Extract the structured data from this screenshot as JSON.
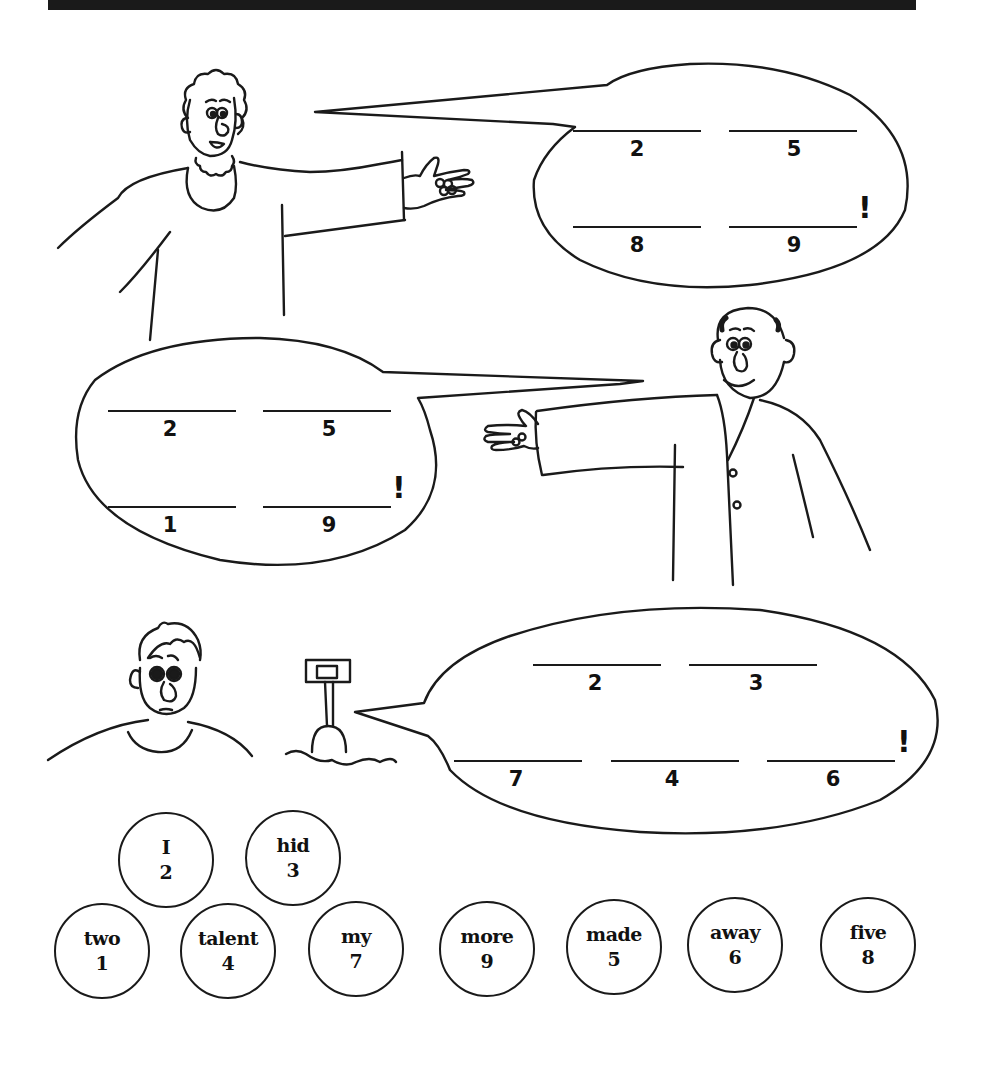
{
  "page": {
    "header_bar_color": "#1a1a1a",
    "line_color": "#1a1a1a"
  },
  "panels": [
    {
      "id": "panel-1",
      "character": "curly-haired woman holding coins",
      "speech_bubble": {
        "rows": [
          [
            {
              "number": "2"
            },
            {
              "number": "5"
            }
          ],
          [
            {
              "number": "8"
            },
            {
              "number": "9"
            }
          ]
        ],
        "ending": "!"
      }
    },
    {
      "id": "panel-2",
      "character": "balding man holding coins",
      "speech_bubble": {
        "rows": [
          [
            {
              "number": "2"
            },
            {
              "number": "5"
            }
          ],
          [
            {
              "number": "1"
            },
            {
              "number": "9"
            }
          ]
        ],
        "ending": "!"
      }
    },
    {
      "id": "panel-3",
      "character": "worried man with shovel in dirt",
      "speech_bubble": {
        "rows": [
          [
            {
              "number": "2"
            },
            {
              "number": "3"
            }
          ],
          [
            {
              "number": "7"
            },
            {
              "number": "4"
            },
            {
              "number": "6"
            }
          ]
        ],
        "ending": "!"
      }
    }
  ],
  "word_bank": [
    {
      "word": "I",
      "number": "2"
    },
    {
      "word": "hid",
      "number": "3"
    },
    {
      "word": "two",
      "number": "1"
    },
    {
      "word": "talent",
      "number": "4"
    },
    {
      "word": "my",
      "number": "7"
    },
    {
      "word": "more",
      "number": "9"
    },
    {
      "word": "made",
      "number": "5"
    },
    {
      "word": "away",
      "number": "6"
    },
    {
      "word": "five",
      "number": "8"
    }
  ]
}
